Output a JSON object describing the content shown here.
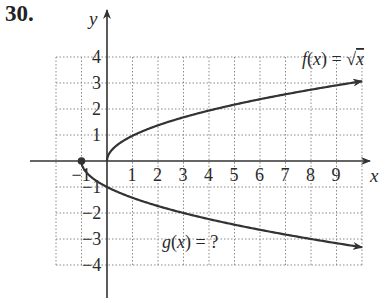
{
  "problem": {
    "number": "30."
  },
  "chart_data": {
    "type": "line",
    "title": "",
    "xlabel": "x",
    "ylabel": "y",
    "xlim": [
      -2,
      10
    ],
    "ylim": [
      -4,
      4
    ],
    "grid": true,
    "grid_style": "dotted",
    "x_ticks": [
      "-1",
      "1",
      "2",
      "3",
      "4",
      "5",
      "6",
      "7",
      "8",
      "9"
    ],
    "y_ticks": [
      "4",
      "3",
      "2",
      "1",
      "-1",
      "-2",
      "-3",
      "-4"
    ],
    "series": [
      {
        "name": "f(x) = √x",
        "label_parts": {
          "prefix": "f(x) = ",
          "radical": "√",
          "radicand": "x"
        },
        "x": [
          0,
          0.25,
          1,
          2,
          3,
          4,
          5,
          6,
          7,
          8,
          9,
          10
        ],
        "y": [
          0,
          0.5,
          1,
          1.41,
          1.73,
          2,
          2.24,
          2.45,
          2.65,
          2.83,
          3,
          3.08
        ],
        "arrow_end": true
      },
      {
        "name": "g(x) = ?",
        "x": [
          -1,
          -0.75,
          0,
          1,
          2,
          3,
          4,
          5,
          6,
          7,
          8,
          9,
          10
        ],
        "y": [
          0,
          -0.5,
          -1,
          -1.41,
          -1.73,
          -2,
          -2.24,
          -2.45,
          -2.65,
          -2.83,
          -3,
          -3.16,
          -3.3
        ],
        "arrow_end": true,
        "start_point": {
          "x": -1,
          "y": 0,
          "marker": "filled-circle"
        }
      }
    ],
    "annotations": [
      {
        "text": "f(x) = √x",
        "near": {
          "x": 8.5,
          "y": 3.6
        }
      },
      {
        "text": "g(x) = ?",
        "near": {
          "x": 3.5,
          "y": -3.3
        }
      }
    ]
  },
  "labels": {
    "x_axis": "x",
    "y_axis": "y",
    "f_prefix": "f(x) = ",
    "f_radical": "√",
    "f_radicand": "x",
    "g_label": "g(x) = ?"
  }
}
